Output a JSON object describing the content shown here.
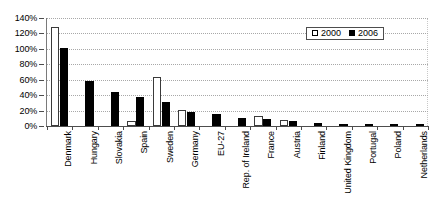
{
  "chart_data": {
    "type": "bar",
    "title": "",
    "xlabel": "",
    "ylabel": "",
    "ylim": [
      0,
      140
    ],
    "ytick_labels": [
      "140%",
      "120%",
      "100%",
      "80%",
      "60%",
      "40%",
      "20%",
      "0%"
    ],
    "ytick_values": [
      140,
      120,
      100,
      80,
      60,
      40,
      20,
      0
    ],
    "grid": true,
    "legend_position": "top-right",
    "categories": [
      "Denmark",
      "Hungary",
      "Slovakia",
      "Spain",
      "Sweden",
      "Germany",
      "EU-27",
      "Rep. of Ireland",
      "France",
      "Austria",
      "Finland",
      "United Kingdom",
      "Portugal",
      "Poland",
      "Netherlands"
    ],
    "series": [
      {
        "name": "2000",
        "color": "#ffffff",
        "values": [
          128,
          0,
          0,
          7,
          63,
          21,
          0,
          0,
          13,
          8,
          0,
          0,
          0,
          0,
          0
        ]
      },
      {
        "name": "2006",
        "color": "#000000",
        "values": [
          101,
          58,
          44,
          38,
          31,
          18,
          15,
          10,
          9,
          6,
          4,
          3,
          3,
          2,
          2
        ]
      }
    ]
  },
  "legend": {
    "entries": [
      {
        "label": "2000",
        "swatch": "open-square"
      },
      {
        "label": "2006",
        "swatch": "filled-square"
      }
    ]
  }
}
